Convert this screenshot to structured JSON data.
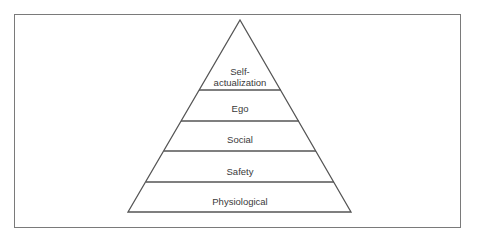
{
  "diagram": {
    "type": "pyramid",
    "levels_top_to_bottom": [
      {
        "label_lines": [
          "Self-",
          "actualization"
        ],
        "label": "Self-actualization"
      },
      {
        "label_lines": [
          "Ego"
        ],
        "label": "Ego"
      },
      {
        "label_lines": [
          "Social"
        ],
        "label": "Social"
      },
      {
        "label_lines": [
          "Safety"
        ],
        "label": "Safety"
      },
      {
        "label_lines": [
          "Physiological"
        ],
        "label": "Physiological"
      }
    ],
    "colors": {
      "stroke": "#555555",
      "frame": "#7a7a7a",
      "text": "#3a3a3a",
      "background": "#ffffff"
    }
  }
}
